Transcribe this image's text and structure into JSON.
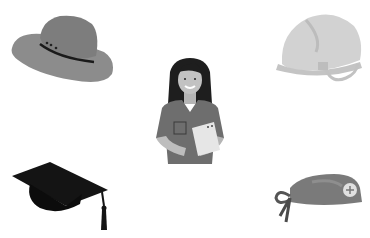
{
  "scene": {
    "background": "#ffffff",
    "description": "Grayscale illustration of a nurse/doctor surrounded by four headwear items",
    "items": [
      {
        "name": "cowboy-hat",
        "position": "top-left"
      },
      {
        "name": "hard-hat",
        "position": "top-right"
      },
      {
        "name": "nurse-figure",
        "position": "center"
      },
      {
        "name": "graduation-cap",
        "position": "bottom-left"
      },
      {
        "name": "surgical-cap",
        "position": "bottom-right"
      }
    ]
  },
  "colors": {
    "hat_gray": "#8a8a8a",
    "hard_hat": "#d4d4d4",
    "cap_black": "#141414",
    "scrubs": "#6e6e6e",
    "skin": "#bdbdbd",
    "hair": "#1e1e1e",
    "clipboard": "#e6e6e6",
    "surgical_cap": "#7a7a7a"
  }
}
